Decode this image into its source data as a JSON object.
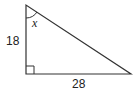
{
  "diagram": {
    "type": "right-triangle",
    "vertices": {
      "top": [
        26,
        5
      ],
      "right_angle": [
        26,
        74
      ],
      "right": [
        131,
        74
      ]
    },
    "labels": {
      "vertical_leg": "18",
      "horizontal_leg": "28",
      "angle": "x"
    },
    "colors": {
      "stroke": "#333333",
      "text": "#222222",
      "background": "#ffffff"
    }
  }
}
